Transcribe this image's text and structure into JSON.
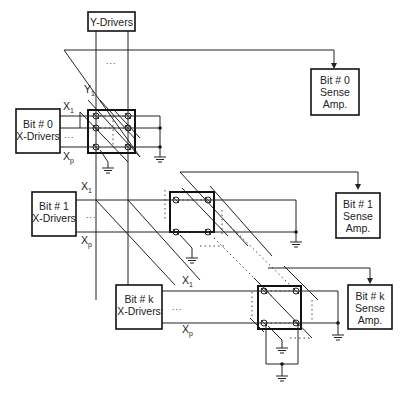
{
  "diagram": {
    "y_drivers": {
      "label": "Y-Drivers",
      "line_label": "Y",
      "line_sub": "1"
    },
    "ellipsis": "...",
    "x_drivers": [
      {
        "line1": "Bit # 0",
        "line2": "X-Drivers",
        "x1": "X",
        "x1_sub": "1",
        "xp": "X",
        "xp_sub": "p"
      },
      {
        "line1": "Bit # 1",
        "line2": "X-Drivers",
        "x1": "X",
        "x1_sub": "1",
        "xp": "X",
        "xp_sub": "p"
      },
      {
        "line1": "Bit # k",
        "line2": "X-Drivers",
        "x1": "X",
        "x1_sub": "1",
        "xp": "X",
        "xp_sub": "p"
      }
    ],
    "extra_x1": {
      "label": "X",
      "sub": "1"
    },
    "sense_amps": [
      {
        "line1": "Bit # 0",
        "line2": "Sense",
        "line3": "Amp."
      },
      {
        "line1": "Bit # 1",
        "line2": "Sense",
        "line3": "Amp."
      },
      {
        "line1": "Bit # k",
        "line2": "Sense",
        "line3": "Amp."
      }
    ]
  }
}
